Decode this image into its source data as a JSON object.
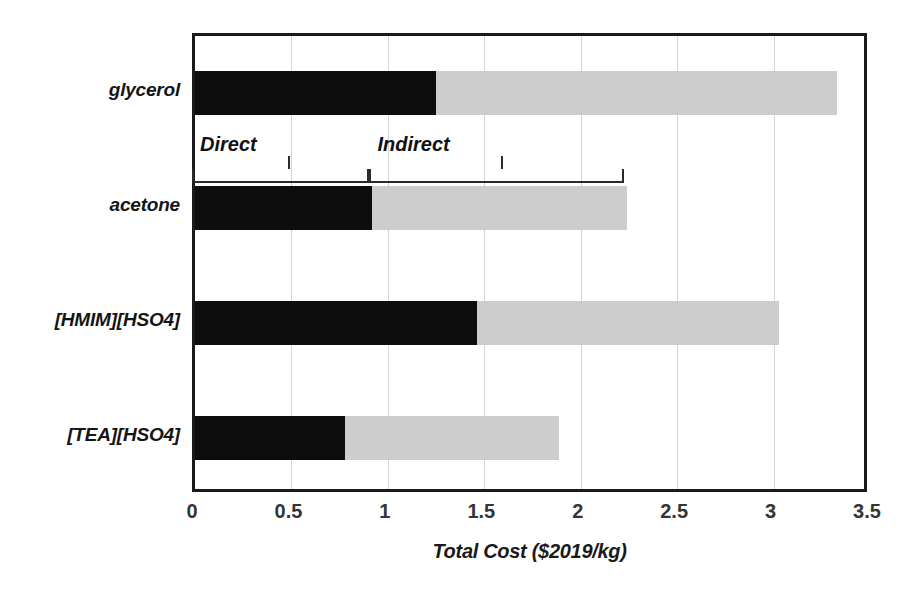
{
  "chart_data": {
    "type": "bar",
    "orientation": "horizontal",
    "stacked": true,
    "title": "",
    "xlabel": "Total Cost ($2019/kg)",
    "ylabel": "",
    "xlim": [
      0,
      3.5
    ],
    "xticks": [
      "0",
      "0.5",
      "1",
      "1.5",
      "2",
      "2.5",
      "3",
      "3.5"
    ],
    "xtick_values": [
      0,
      0.5,
      1,
      1.5,
      2,
      2.5,
      3,
      3.5
    ],
    "grid": "vertical",
    "legend": "none",
    "categories": [
      "glycerol",
      "acetone",
      "[HMIM][HSO4]",
      "[TEA][HSO4]"
    ],
    "series": [
      {
        "name": "Direct",
        "color": "#0d0d0d",
        "values": [
          1.25,
          0.92,
          1.46,
          0.78
        ]
      },
      {
        "name": "Indirect",
        "color": "#cdcdcd",
        "values": [
          2.08,
          1.32,
          1.57,
          1.11
        ]
      }
    ],
    "totals": [
      3.33,
      2.24,
      3.03,
      1.89
    ],
    "annotations": [
      {
        "label": "Direct",
        "start": 0.0,
        "end": 0.92,
        "tick": 0.5
      },
      {
        "label": "Indirect",
        "start": 0.92,
        "end": 2.24,
        "tick": 1.6
      }
    ]
  },
  "axis": {
    "x_title": "Total Cost ($2019/kg)",
    "ticks": [
      "0",
      "0.5",
      "1",
      "1.5",
      "2",
      "2.5",
      "3",
      "3.5"
    ]
  },
  "categories": {
    "c0": "glycerol",
    "c1": "acetone",
    "c2": "[HMIM][HSO4]",
    "c3": "[TEA][HSO4]"
  },
  "annotations": {
    "direct": "Direct",
    "indirect": "Indirect"
  },
  "colors": {
    "direct": "#0d0d0d",
    "indirect": "#cdcdcd",
    "frame": "#1a1a1a",
    "grid": "#d4d4d4",
    "text": "#1a1a1a"
  }
}
